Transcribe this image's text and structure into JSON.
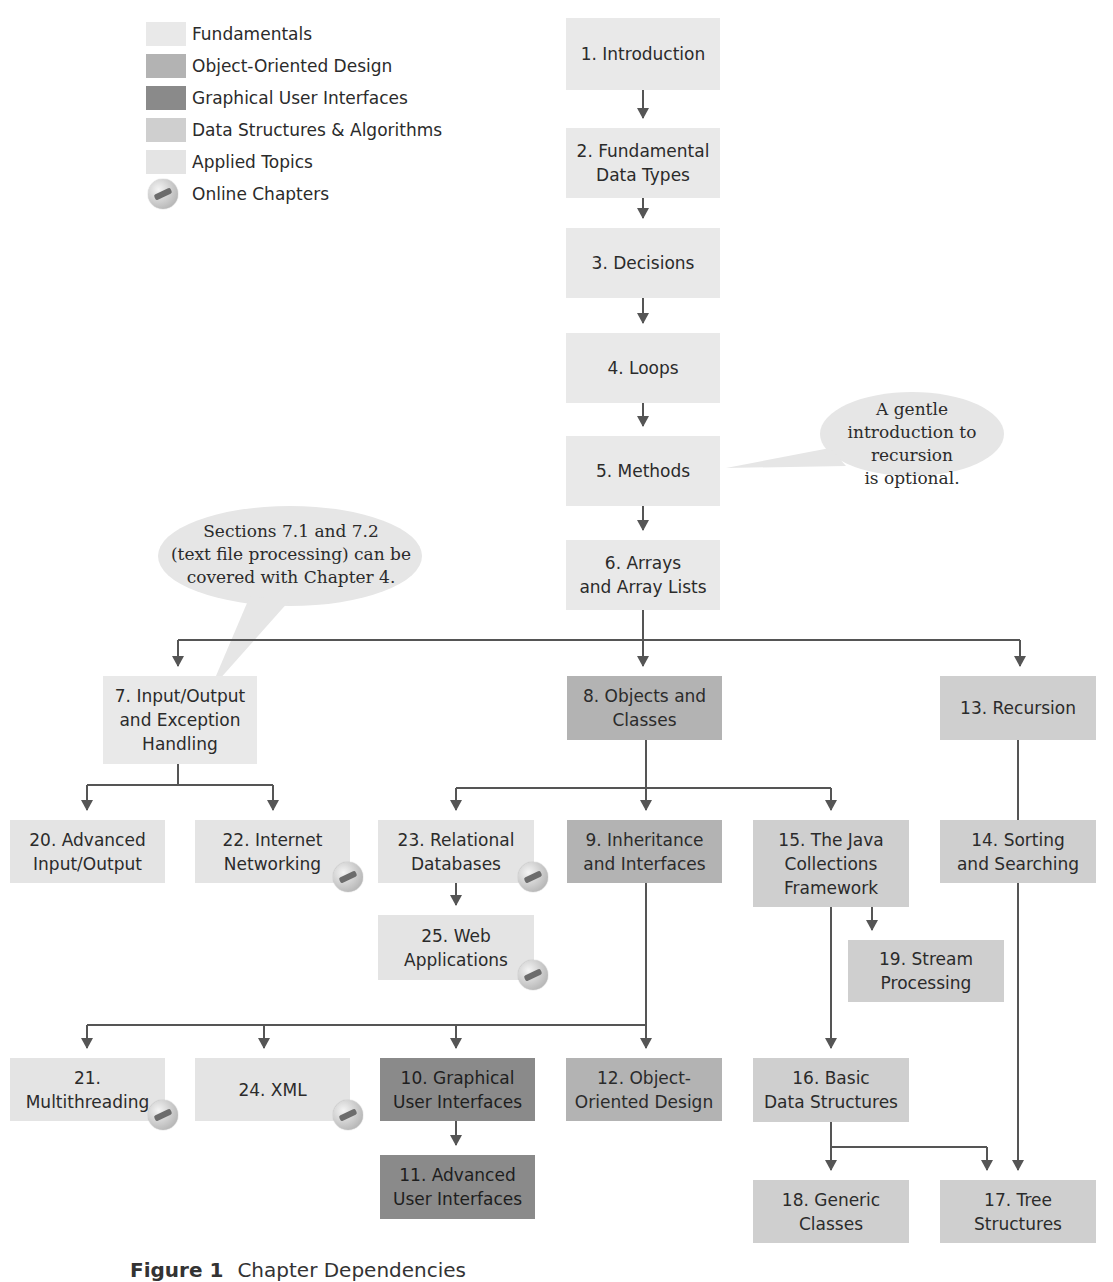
{
  "legend": [
    {
      "label": "Fundamentals",
      "color": "#e9e9e9",
      "type": "swatch"
    },
    {
      "label": "Object-Oriented Design",
      "color": "#b3b3b3",
      "type": "swatch"
    },
    {
      "label": "Graphical User Interfaces",
      "color": "#8a8a8a",
      "type": "swatch"
    },
    {
      "label": "Data Structures & Algorithms",
      "color": "#cfcfcf",
      "type": "swatch"
    },
    {
      "label": "Applied Topics",
      "color": "#e4e4e4",
      "type": "swatch"
    },
    {
      "label": "Online Chapters",
      "icon": "cd-disc-icon",
      "type": "icon"
    }
  ],
  "chapters": {
    "c1": {
      "label": "1. Introduction",
      "category": "Fundamentals"
    },
    "c2": {
      "label": "2. Fundamental\nData Types",
      "category": "Fundamentals"
    },
    "c3": {
      "label": "3. Decisions",
      "category": "Fundamentals"
    },
    "c4": {
      "label": "4. Loops",
      "category": "Fundamentals"
    },
    "c5": {
      "label": "5. Methods",
      "category": "Fundamentals"
    },
    "c6": {
      "label": "6. Arrays\nand Array Lists",
      "category": "Fundamentals"
    },
    "c7": {
      "label": "7. Input/Output\nand Exception\nHandling",
      "category": "Fundamentals"
    },
    "c8": {
      "label": "8. Objects and\nClasses",
      "category": "Object-Oriented Design"
    },
    "c9": {
      "label": "9. Inheritance\nand Interfaces",
      "category": "Object-Oriented Design"
    },
    "c10": {
      "label": "10. Graphical\nUser Interfaces",
      "category": "Graphical User Interfaces"
    },
    "c11": {
      "label": "11. Advanced\nUser Interfaces",
      "category": "Graphical User Interfaces"
    },
    "c12": {
      "label": "12. Object-\nOriented Design",
      "category": "Object-Oriented Design"
    },
    "c13": {
      "label": "13. Recursion",
      "category": "Data Structures & Algorithms"
    },
    "c14": {
      "label": "14. Sorting\nand Searching",
      "category": "Data Structures & Algorithms"
    },
    "c15": {
      "label": "15. The Java\nCollections\nFramework",
      "category": "Data Structures & Algorithms"
    },
    "c16": {
      "label": "16. Basic\nData Structures",
      "category": "Data Structures & Algorithms"
    },
    "c17": {
      "label": "17. Tree\nStructures",
      "category": "Data Structures & Algorithms"
    },
    "c18": {
      "label": "18. Generic\nClasses",
      "category": "Data Structures & Algorithms"
    },
    "c19": {
      "label": "19. Stream\nProcessing",
      "category": "Data Structures & Algorithms"
    },
    "c20": {
      "label": "20. Advanced\nInput/Output",
      "category": "Applied Topics"
    },
    "c21": {
      "label": "21.\nMultithreading",
      "category": "Applied Topics",
      "online": true
    },
    "c22": {
      "label": "22. Internet\nNetworking",
      "category": "Applied Topics",
      "online": true
    },
    "c23": {
      "label": "23. Relational\nDatabases",
      "category": "Applied Topics",
      "online": true
    },
    "c24": {
      "label": "24. XML",
      "category": "Applied Topics",
      "online": true
    },
    "c25": {
      "label": "25. Web\nApplications",
      "category": "Applied Topics",
      "online": true
    }
  },
  "notes": {
    "recursion": "A gentle\nintroduction to recursion\nis optional.",
    "text_files": "Sections 7.1 and 7.2\n(text file processing) can be\ncovered with Chapter 4."
  },
  "edges": [
    [
      "1",
      "2"
    ],
    [
      "2",
      "3"
    ],
    [
      "3",
      "4"
    ],
    [
      "4",
      "5"
    ],
    [
      "5",
      "6"
    ],
    [
      "6",
      "7"
    ],
    [
      "6",
      "8"
    ],
    [
      "6",
      "13"
    ],
    [
      "7",
      "20"
    ],
    [
      "7",
      "22"
    ],
    [
      "8",
      "23"
    ],
    [
      "8",
      "9"
    ],
    [
      "8",
      "15"
    ],
    [
      "23",
      "25"
    ],
    [
      "15",
      "19"
    ],
    [
      "15",
      "16"
    ],
    [
      "13",
      "14"
    ],
    [
      "14",
      "17"
    ],
    [
      "9",
      "21"
    ],
    [
      "9",
      "24"
    ],
    [
      "9",
      "10"
    ],
    [
      "9",
      "12"
    ],
    [
      "10",
      "11"
    ],
    [
      "16",
      "18"
    ],
    [
      "16",
      "17"
    ]
  ],
  "caption": {
    "label": "Figure 1",
    "text": "Chapter Dependencies"
  },
  "colors": {
    "arrow": "#555555",
    "bubble": "#e6e6e6"
  }
}
